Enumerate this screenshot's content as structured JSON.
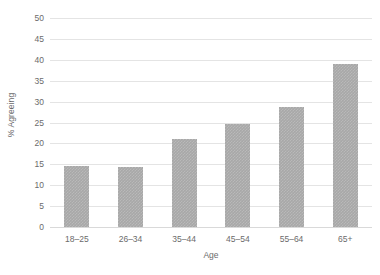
{
  "chart_data": {
    "type": "bar",
    "title": "",
    "subtitle": "",
    "xlabel": "Age",
    "ylabel": "% Agreeing",
    "categories": [
      "18–25",
      "26–34",
      "35–44",
      "45–54",
      "55–64",
      "65+"
    ],
    "values": [
      14.5,
      14.4,
      21.0,
      24.6,
      28.7,
      39.0
    ],
    "series": [
      {
        "name": "% Agreeing",
        "values": [
          14.5,
          14.4,
          21.0,
          24.6,
          28.7,
          39.0
        ]
      }
    ],
    "ylim": [
      0,
      50
    ],
    "ytick_step": 5,
    "yticks": [
      0,
      5,
      10,
      15,
      20,
      25,
      30,
      35,
      40,
      45,
      50
    ],
    "ytick_labels": [
      "0",
      "5",
      "10",
      "15",
      "20",
      "25",
      "30",
      "35",
      "40",
      "45",
      "50"
    ],
    "grid": true,
    "grid_axis": "y",
    "legend": false,
    "legend_position": "none",
    "annotations": [],
    "colors": {
      "bar": "#a8a8a8",
      "gridline": "#e4e4e4",
      "baseline": "#d9d9d9",
      "text": "#6b6b6b",
      "background": "#ffffff"
    }
  }
}
